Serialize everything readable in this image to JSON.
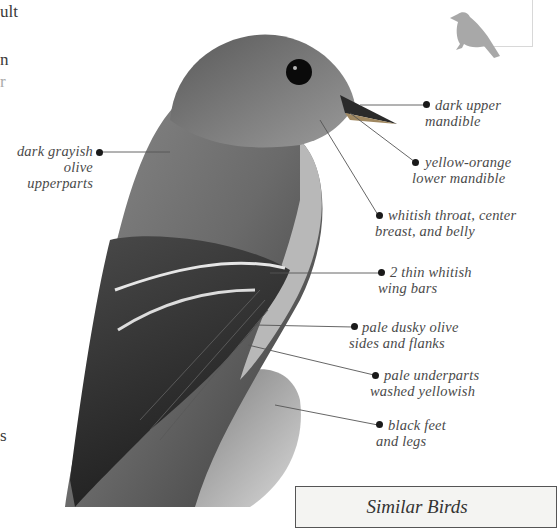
{
  "page": {
    "edge_text": [
      {
        "text": "ult",
        "x": 0,
        "y": 2
      },
      {
        "text": "n",
        "x": 0,
        "y": 50
      },
      {
        "text": "r",
        "x": 0,
        "y": 72
      },
      {
        "text": "s",
        "x": 0,
        "y": 434
      }
    ]
  },
  "illustration": {
    "subject": "bird-illustration",
    "silhouette_icon": "perched-bird-silhouette"
  },
  "callouts": [
    {
      "id": "upperparts",
      "lines": [
        "dark grayish",
        "olive upperparts"
      ]
    },
    {
      "id": "upper-mandible",
      "lines": [
        "dark upper",
        "mandible"
      ]
    },
    {
      "id": "lower-mandible",
      "lines": [
        "yellow-orange",
        "lower mandible"
      ]
    },
    {
      "id": "throat",
      "lines": [
        "whitish throat, center",
        "breast, and belly"
      ]
    },
    {
      "id": "wing-bars",
      "lines": [
        "2 thin whitish",
        "wing bars"
      ]
    },
    {
      "id": "sides",
      "lines": [
        "pale dusky olive",
        "sides and flanks"
      ]
    },
    {
      "id": "underparts",
      "lines": [
        "pale underparts",
        "washed yellowish"
      ]
    },
    {
      "id": "feet",
      "lines": [
        "black feet",
        "and legs"
      ]
    }
  ],
  "similar_birds": {
    "title": "Similar Birds"
  },
  "colors": {
    "text": "#4a4a4a",
    "leader_line": "#555555",
    "dot": "#1a1a1a",
    "box_fill": "#f4f4f2"
  }
}
